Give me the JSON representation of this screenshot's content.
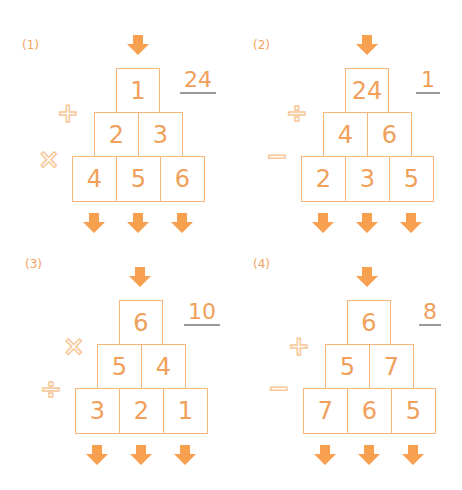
{
  "colors": {
    "number": "#f0a05a",
    "border": "#f7b57a",
    "arrow": "#f7a050",
    "operator": "#f8c899",
    "underline": "#9a9a9a"
  },
  "puzzles": [
    {
      "label": "(1)",
      "answer": "24",
      "top": "1",
      "middle": [
        "2",
        "3"
      ],
      "bottom": [
        "4",
        "5",
        "6"
      ],
      "op_upper": "+",
      "op_lower": "×"
    },
    {
      "label": "(2)",
      "answer": "1",
      "top": "24",
      "middle": [
        "4",
        "6"
      ],
      "bottom": [
        "2",
        "3",
        "5"
      ],
      "op_upper": "÷",
      "op_lower": "−"
    },
    {
      "label": "(3)",
      "answer": "10",
      "top": "6",
      "middle": [
        "5",
        "4"
      ],
      "bottom": [
        "3",
        "2",
        "1"
      ],
      "op_upper": "×",
      "op_lower": "÷"
    },
    {
      "label": "(4)",
      "answer": "8",
      "top": "6",
      "middle": [
        "5",
        "7"
      ],
      "bottom": [
        "7",
        "6",
        "5"
      ],
      "op_upper": "+",
      "op_lower": "−"
    }
  ]
}
